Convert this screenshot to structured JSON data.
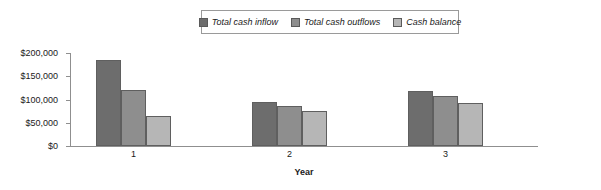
{
  "chart_data": {
    "type": "bar",
    "title": "",
    "xlabel": "Year",
    "ylabel": "",
    "categories": [
      "1",
      "2",
      "3"
    ],
    "series": [
      {
        "name": "Total cash inflow",
        "color": "#6d6d6d",
        "values": [
          185000,
          95000,
          118000
        ]
      },
      {
        "name": "Total cash outflows",
        "color": "#8e8e8e",
        "values": [
          120000,
          85000,
          107000
        ]
      },
      {
        "name": "Cash balance",
        "color": "#b6b6b6",
        "values": [
          65000,
          76000,
          92000
        ]
      }
    ],
    "ylim": [
      0,
      200000
    ],
    "ytick_values": [
      0,
      50000,
      100000,
      150000,
      200000
    ],
    "ytick_labels": [
      "$0",
      "$50,000",
      "$100,000",
      "$150,000",
      "$200,000"
    ],
    "grid": false,
    "legend_position": "top-center"
  },
  "legend": {
    "items": [
      {
        "label": "Total cash inflow"
      },
      {
        "label": "Total cash outflows"
      },
      {
        "label": "Cash balance"
      }
    ]
  },
  "axes": {
    "x_title": "Year",
    "x_tick_labels": [
      "1",
      "2",
      "3"
    ],
    "y_tick_labels": [
      "$200,000",
      "$150,000",
      "$100,000",
      "$50,000",
      "$0"
    ]
  }
}
